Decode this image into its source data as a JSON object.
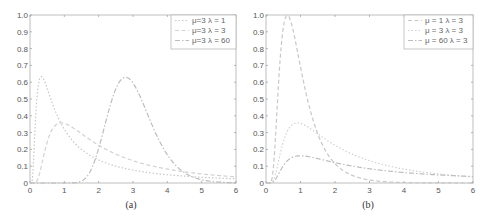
{
  "chart_data": [
    {
      "type": "line",
      "caption": "(a)",
      "title": "",
      "xlabel": "",
      "ylabel": "",
      "xlim": [
        0,
        6
      ],
      "ylim": [
        0,
        1.0
      ],
      "xticks": [
        "0",
        "1",
        "2",
        "3",
        "4",
        "5",
        "6"
      ],
      "yticks": [
        "0",
        "0.1",
        "0.2",
        "0.3",
        "0.4",
        "0.5",
        "0.6",
        "0.7",
        "0.8",
        "0.9",
        "1.0"
      ],
      "grid": false,
      "legend_position": "upper right",
      "x": [
        0.1,
        0.3,
        0.5,
        0.8,
        1.0,
        1.5,
        2.0,
        2.5,
        2.75,
        3.0,
        3.5,
        4.0,
        5.0,
        6.0
      ],
      "series": [
        {
          "name": "μ=3  λ = 1",
          "mu": 3,
          "lambda": 1,
          "style": "dotted",
          "color": "#c8c8c8",
          "values": [
            0.55,
            0.62,
            0.52,
            0.38,
            0.32,
            0.21,
            0.15,
            0.11,
            0.09,
            0.08,
            0.06,
            0.05,
            0.03,
            0.02
          ]
        },
        {
          "name": "μ=3  λ = 3",
          "mu": 3,
          "lambda": 3,
          "style": "dashed",
          "color": "#d2d2d2",
          "values": [
            0.0,
            0.12,
            0.27,
            0.35,
            0.35,
            0.3,
            0.24,
            0.18,
            0.16,
            0.14,
            0.11,
            0.08,
            0.05,
            0.03
          ]
        },
        {
          "name": "μ=3  λ = 60",
          "mu": 3,
          "lambda": 60,
          "style": "dashdot",
          "color": "#bdbdbd",
          "values": [
            0.0,
            0.0,
            0.0,
            0.0,
            0.0,
            0.01,
            0.2,
            0.55,
            0.63,
            0.6,
            0.35,
            0.16,
            0.02,
            0.0
          ]
        }
      ],
      "legend": [
        "μ=3  λ = 1",
        "μ=3  λ = 3",
        "μ=3  λ = 60"
      ]
    },
    {
      "type": "line",
      "caption": "(b)",
      "title": "",
      "xlabel": "",
      "ylabel": "",
      "xlim": [
        0,
        6
      ],
      "ylim": [
        0,
        1.0
      ],
      "xticks": [
        "0",
        "1",
        "2",
        "3",
        "4",
        "5",
        "6"
      ],
      "yticks": [
        "0",
        "0.1",
        "0.2",
        "0.3",
        "0.4",
        "0.5",
        "0.6",
        "0.7",
        "0.8",
        "0.9",
        "1.0"
      ],
      "grid": false,
      "legend_position": "upper right",
      "x": [
        0.1,
        0.3,
        0.6,
        0.8,
        1.0,
        1.5,
        2.0,
        2.5,
        3.0,
        4.0,
        5.0,
        6.0
      ],
      "series": [
        {
          "name": "μ = 1    λ = 3",
          "mu": 1,
          "lambda": 3,
          "style": "dashed",
          "color": "#c8c8c8",
          "values": [
            0.0,
            0.45,
            0.99,
            0.86,
            0.69,
            0.31,
            0.12,
            0.05,
            0.02,
            0.0,
            0.0,
            0.0
          ]
        },
        {
          "name": "μ = 3    λ = 3",
          "mu": 3,
          "lambda": 3,
          "style": "dotted",
          "color": "#d2d2d2",
          "values": [
            0.0,
            0.12,
            0.31,
            0.35,
            0.35,
            0.3,
            0.24,
            0.18,
            0.14,
            0.08,
            0.05,
            0.03
          ]
        },
        {
          "name": "μ = 60  λ = 3",
          "mu": 60,
          "lambda": 3,
          "style": "dashdot",
          "color": "#bdbdbd",
          "values": [
            0.0,
            0.05,
            0.14,
            0.16,
            0.16,
            0.14,
            0.11,
            0.09,
            0.08,
            0.06,
            0.05,
            0.04
          ]
        }
      ],
      "legend": [
        "μ = 1    λ = 3",
        "μ = 3    λ = 3",
        "μ = 60  λ = 3"
      ]
    }
  ],
  "layout": {
    "panels": [
      {
        "left": 30,
        "right": 236,
        "top": 15,
        "bottom": 183,
        "caption_x": 131,
        "caption_y": 208,
        "legend": {
          "x": 171,
          "y": 15,
          "w": 65,
          "h": 34
        }
      },
      {
        "left": 266,
        "right": 473,
        "top": 15,
        "bottom": 183,
        "caption_x": 368,
        "caption_y": 208,
        "legend": {
          "x": 404,
          "y": 15,
          "w": 69,
          "h": 34
        }
      }
    ]
  }
}
